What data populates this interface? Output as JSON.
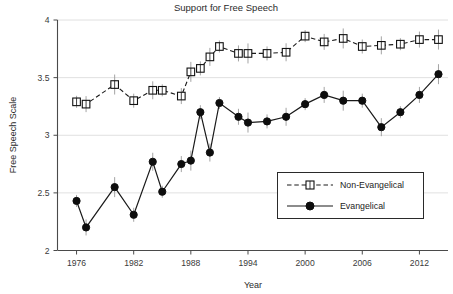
{
  "chart_data": {
    "type": "line",
    "title": "Support for Free Speech",
    "xlabel": "Year",
    "ylabel": "Free Speech Scale",
    "xlim": [
      1974,
      2015
    ],
    "ylim": [
      2,
      4
    ],
    "xticks": [
      1976,
      1982,
      1988,
      1994,
      2000,
      2006,
      2012
    ],
    "xtick_labels": [
      "1976",
      "1982",
      "1988",
      "1994",
      "2000",
      "2006",
      "2012"
    ],
    "yticks": [
      2,
      2.5,
      3,
      3.5,
      4
    ],
    "ytick_labels": [
      "2",
      "2.5",
      "3",
      "3.5",
      "4"
    ],
    "grid": true,
    "grid_axis": "y",
    "legend_position": "center-right",
    "error_bars": true,
    "series": [
      {
        "name": "Non-Evangelical",
        "marker": "open-square",
        "linestyle": "dashed",
        "color": "#111111",
        "x": [
          1976,
          1977,
          1980,
          1982,
          1984,
          1985,
          1987,
          1988,
          1989,
          1990,
          1991,
          1993,
          1994,
          1996,
          1998,
          2000,
          2002,
          2004,
          2006,
          2008,
          2010,
          2012,
          2014
        ],
        "y": [
          3.29,
          3.27,
          3.44,
          3.3,
          3.39,
          3.39,
          3.34,
          3.55,
          3.58,
          3.68,
          3.77,
          3.71,
          3.71,
          3.71,
          3.72,
          3.86,
          3.81,
          3.84,
          3.77,
          3.78,
          3.79,
          3.83,
          3.83
        ]
      },
      {
        "name": "Evangelical",
        "marker": "filled-circle",
        "linestyle": "solid",
        "color": "#0d0d0d",
        "x": [
          1976,
          1977,
          1980,
          1982,
          1984,
          1985,
          1987,
          1988,
          1989,
          1990,
          1991,
          1993,
          1994,
          1996,
          1998,
          2000,
          2002,
          2004,
          2006,
          2008,
          2010,
          2012,
          2014
        ],
        "y": [
          2.43,
          2.2,
          2.55,
          2.31,
          2.77,
          2.51,
          2.75,
          2.78,
          3.2,
          2.85,
          3.28,
          3.16,
          3.11,
          3.12,
          3.16,
          3.27,
          3.35,
          3.3,
          3.3,
          3.07,
          3.2,
          3.35,
          3.53
        ]
      }
    ]
  },
  "legend": {
    "items": [
      {
        "label": "Non-Evangelical"
      },
      {
        "label": "Evangelical"
      }
    ]
  }
}
